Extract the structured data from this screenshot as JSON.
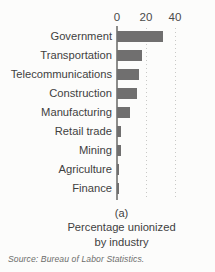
{
  "figure": {
    "background_color": "#fcfcfb",
    "caption_index": "(a)",
    "caption_line1": "Percentage unionized",
    "caption_line2": "by industry",
    "source": "Source: Bureau of Labor Statistics."
  },
  "chart_data": {
    "type": "bar",
    "orientation": "horizontal",
    "title": "Percentage unionized by industry",
    "xlabel": "",
    "ylabel": "",
    "xlim": [
      0,
      48
    ],
    "xticks": [
      0,
      20,
      40
    ],
    "xtick_labels": [
      "0",
      "20",
      "40"
    ],
    "grid": true,
    "grid_style": "dotted vertical",
    "legend": "none",
    "bar_color": "#706f6f",
    "axis_color": "#8d8d8b",
    "gridline_color": "#c9c9c7",
    "categories": [
      "Government",
      "Transportation",
      "Telecommunications",
      "Construction",
      "Manufacturing",
      "Retail trade",
      "Mining",
      "Agriculture",
      "Finance"
    ],
    "values": [
      32,
      17,
      15,
      14,
      9,
      3,
      3,
      1.5,
      0.7
    ]
  }
}
